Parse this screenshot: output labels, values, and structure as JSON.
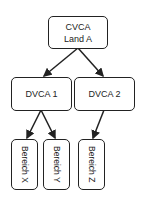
{
  "nodes": {
    "root": {
      "line1": "CVCA",
      "line2": "Land A"
    },
    "dvca1": {
      "label": "DVCA 1"
    },
    "dvca2": {
      "label": "DVCA 2"
    },
    "bx": {
      "label": "Bereich X"
    },
    "by": {
      "label": "Bereich Y"
    },
    "bz": {
      "label": "Bereich Z"
    }
  },
  "edges": [
    {
      "from": "CVCA Land A",
      "to": "DVCA 1"
    },
    {
      "from": "CVCA Land A",
      "to": "DVCA 2"
    },
    {
      "from": "DVCA 1",
      "to": "Bereich X"
    },
    {
      "from": "DVCA 1",
      "to": "Bereich Y"
    },
    {
      "from": "DVCA 2",
      "to": "Bereich Z"
    }
  ]
}
